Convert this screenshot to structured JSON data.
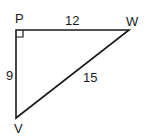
{
  "diagram": {
    "type": "right-triangle",
    "vertices": {
      "P": {
        "label": "P",
        "x": 16,
        "y": 30,
        "right_angle": true
      },
      "W": {
        "label": "W",
        "x": 129,
        "y": 30
      },
      "V": {
        "label": "V",
        "x": 16,
        "y": 118
      }
    },
    "sides": {
      "PW": {
        "label": "12"
      },
      "PV": {
        "label": "9"
      },
      "VW": {
        "label": "15"
      }
    },
    "colors": {
      "stroke": "#1a1a1a",
      "background": "#ffffff"
    }
  }
}
